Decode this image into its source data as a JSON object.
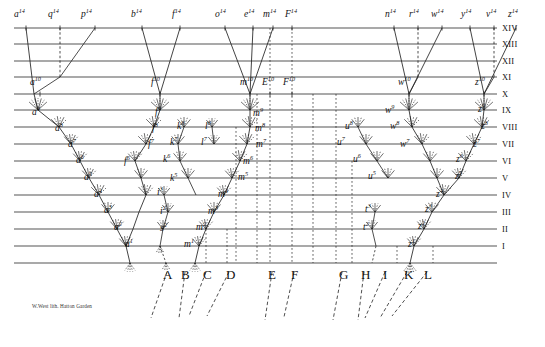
{
  "figure": {
    "credit": "W.West lith.  Hatton Garden",
    "colors": {
      "line": "#555555",
      "thin_line": "#222222",
      "text": "#111111",
      "background": "#ffffff"
    }
  },
  "levels": {
    "labels": [
      "I",
      "II",
      "III",
      "IV",
      "V",
      "VI",
      "VII",
      "VIII",
      "IX",
      "X",
      "XI",
      "XII",
      "XIII",
      "XIV"
    ],
    "y": [
      246,
      229,
      212,
      195,
      178,
      161,
      144,
      127,
      110,
      94,
      77,
      61,
      44,
      28
    ],
    "baseline_y": 263
  },
  "top_row_14": [
    {
      "name": "a",
      "sup": "14",
      "x": 14,
      "tick": 26
    },
    {
      "name": "q",
      "sup": "14",
      "x": 48,
      "tick": 60
    },
    {
      "name": "p",
      "sup": "14",
      "x": 81,
      "tick": 95
    },
    {
      "name": "b",
      "sup": "14",
      "x": 131,
      "tick": 142
    },
    {
      "name": "f",
      "sup": "14",
      "x": 172,
      "tick": 180
    },
    {
      "name": "o",
      "sup": "14",
      "x": 215,
      "tick": 225
    },
    {
      "name": "e",
      "sup": "14",
      "x": 244,
      "tick": 253
    },
    {
      "name": "m",
      "sup": "14",
      "x": 263,
      "tick": 273
    },
    {
      "name": "F",
      "sup": "14",
      "x": 285,
      "tick": 292
    },
    {
      "name": "n",
      "sup": "14",
      "x": 385,
      "tick": 394
    },
    {
      "name": "r",
      "sup": "14",
      "x": 409,
      "tick": 418
    },
    {
      "name": "w",
      "sup": "14",
      "x": 431,
      "tick": 442
    },
    {
      "name": "y",
      "sup": "14",
      "x": 461,
      "tick": 470
    },
    {
      "name": "v",
      "sup": "14",
      "x": 486,
      "tick": 494
    },
    {
      "name": "z",
      "sup": "14",
      "x": 508,
      "tick": 516
    }
  ],
  "row_10": [
    {
      "name": "a",
      "sup": "10",
      "x": 30,
      "tick": 40
    },
    {
      "name": "f",
      "sup": "10",
      "x": 151,
      "tick": 160
    },
    {
      "name": "m",
      "sup": "10",
      "x": 240,
      "tick": 250
    },
    {
      "name": "E",
      "sup": "10",
      "x": 262,
      "tick": 270
    },
    {
      "name": "F",
      "sup": "10",
      "x": 283,
      "tick": 292
    },
    {
      "name": "w",
      "sup": "10",
      "x": 398,
      "tick": 409
    },
    {
      "name": "z",
      "sup": "10",
      "x": 475,
      "tick": 484
    }
  ],
  "branch_labels": [
    {
      "name": "a",
      "sup": "9",
      "x": 32,
      "y": 106
    },
    {
      "name": "m",
      "sup": "9",
      "x": 253,
      "y": 107
    },
    {
      "name": "f",
      "sup": "9",
      "x": 155,
      "y": 106
    },
    {
      "name": "w",
      "sup": "9",
      "x": 385,
      "y": 104
    },
    {
      "name": "z",
      "sup": "9",
      "x": 478,
      "y": 103
    },
    {
      "name": "a",
      "sup": "8",
      "x": 55,
      "y": 122
    },
    {
      "name": "f",
      "sup": "8",
      "x": 152,
      "y": 122
    },
    {
      "name": "k",
      "sup": "8",
      "x": 177,
      "y": 120
    },
    {
      "name": "l",
      "sup": "8",
      "x": 205,
      "y": 120
    },
    {
      "name": "m",
      "sup": "8",
      "x": 255,
      "y": 122
    },
    {
      "name": "u",
      "sup": "8",
      "x": 345,
      "y": 120
    },
    {
      "name": "w",
      "sup": "8",
      "x": 390,
      "y": 120
    },
    {
      "name": "z",
      "sup": "8",
      "x": 481,
      "y": 120
    },
    {
      "name": "a",
      "sup": "7",
      "x": 68,
      "y": 138
    },
    {
      "name": "f",
      "sup": "7",
      "x": 148,
      "y": 138
    },
    {
      "name": "k",
      "sup": "7",
      "x": 170,
      "y": 136
    },
    {
      "name": "l",
      "sup": "7",
      "x": 201,
      "y": 136
    },
    {
      "name": "m",
      "sup": "7",
      "x": 256,
      "y": 138
    },
    {
      "name": "u",
      "sup": "7",
      "x": 337,
      "y": 136
    },
    {
      "name": "w",
      "sup": "7",
      "x": 400,
      "y": 138
    },
    {
      "name": "z",
      "sup": "7",
      "x": 473,
      "y": 138
    },
    {
      "name": "a",
      "sup": "6",
      "x": 76,
      "y": 154
    },
    {
      "name": "f",
      "sup": "6",
      "x": 124,
      "y": 155
    },
    {
      "name": "k",
      "sup": "6",
      "x": 163,
      "y": 153
    },
    {
      "name": "m",
      "sup": "6",
      "x": 243,
      "y": 155
    },
    {
      "name": "u",
      "sup": "6",
      "x": 353,
      "y": 153
    },
    {
      "name": "z",
      "sup": "6",
      "x": 456,
      "y": 153
    },
    {
      "name": "a",
      "sup": "5",
      "x": 84,
      "y": 171
    },
    {
      "name": "k",
      "sup": "5",
      "x": 170,
      "y": 172
    },
    {
      "name": "m",
      "sup": "5",
      "x": 238,
      "y": 171
    },
    {
      "name": "u",
      "sup": "5",
      "x": 368,
      "y": 170
    },
    {
      "name": "z",
      "sup": "5",
      "x": 455,
      "y": 170
    },
    {
      "name": "a",
      "sup": "4",
      "x": 94,
      "y": 188
    },
    {
      "name": "i",
      "sup": "3",
      "x": 157,
      "y": 186
    },
    {
      "name": "m",
      "sup": "4",
      "x": 218,
      "y": 188
    },
    {
      "name": "z",
      "sup": "4",
      "x": 436,
      "y": 188
    },
    {
      "name": "a",
      "sup": "3",
      "x": 104,
      "y": 204
    },
    {
      "name": "i",
      "sup": "2",
      "x": 160,
      "y": 205
    },
    {
      "name": "m",
      "sup": "3",
      "x": 208,
      "y": 205
    },
    {
      "name": "t",
      "sup": "3",
      "x": 365,
      "y": 203
    },
    {
      "name": "z",
      "sup": "3",
      "x": 425,
      "y": 203
    },
    {
      "name": "a",
      "sup": "2",
      "x": 114,
      "y": 221
    },
    {
      "name": "s",
      "sup": "2",
      "x": 160,
      "y": 222
    },
    {
      "name": "m",
      "sup": "2",
      "x": 196,
      "y": 221
    },
    {
      "name": "t",
      "sup": "2",
      "x": 363,
      "y": 221
    },
    {
      "name": "z",
      "sup": "2",
      "x": 418,
      "y": 220
    },
    {
      "name": "a",
      "sup": "1",
      "x": 125,
      "y": 238
    },
    {
      "name": "m",
      "sup": "1",
      "x": 184,
      "y": 238
    },
    {
      "name": "z",
      "sup": "1",
      "x": 408,
      "y": 238
    }
  ],
  "genera": [
    {
      "label": "A",
      "x": 163,
      "y": 267
    },
    {
      "label": "B",
      "x": 181,
      "y": 267
    },
    {
      "label": "C",
      "x": 203,
      "y": 267
    },
    {
      "label": "D",
      "x": 226,
      "y": 267
    },
    {
      "label": "E",
      "x": 268,
      "y": 267
    },
    {
      "label": "F",
      "x": 291,
      "y": 267
    },
    {
      "label": "G",
      "x": 339,
      "y": 267
    },
    {
      "label": "H",
      "x": 361,
      "y": 267
    },
    {
      "label": "I",
      "x": 383,
      "y": 267
    },
    {
      "label": "K",
      "x": 404,
      "y": 267
    },
    {
      "label": "L",
      "x": 424,
      "y": 267
    }
  ],
  "root_fan": {
    "description": "Dashed lines descending below baseline from genera A-L",
    "lines": [
      {
        "x1": 167,
        "y1": 272,
        "x2": 151,
        "y2": 318
      },
      {
        "x1": 185,
        "y1": 272,
        "x2": 179,
        "y2": 318
      },
      {
        "x1": 206,
        "y1": 272,
        "x2": 189,
        "y2": 316
      },
      {
        "x1": 229,
        "y1": 272,
        "x2": 207,
        "y2": 316
      },
      {
        "x1": 272,
        "y1": 272,
        "x2": 265,
        "y2": 320
      },
      {
        "x1": 294,
        "y1": 272,
        "x2": 284,
        "y2": 317
      },
      {
        "x1": 342,
        "y1": 272,
        "x2": 333,
        "y2": 320
      },
      {
        "x1": 364,
        "y1": 272,
        "x2": 358,
        "y2": 320
      },
      {
        "x1": 385,
        "y1": 272,
        "x2": 365,
        "y2": 318
      },
      {
        "x1": 407,
        "y1": 272,
        "x2": 380,
        "y2": 318
      },
      {
        "x1": 427,
        "y1": 272,
        "x2": 392,
        "y2": 316
      }
    ]
  },
  "long_verticals": [
    {
      "x_top": 60,
      "x_bottom": 60,
      "label": "q14 dashed vertical"
    },
    {
      "x_top": 292,
      "x_bottom": 292,
      "label": "F14 to F"
    },
    {
      "x_top": 270,
      "x_bottom": 270,
      "label": "E14 to E"
    },
    {
      "x_top": 418,
      "x_bottom": 418,
      "label": "r14 dashed"
    },
    {
      "x_top": 494,
      "x_bottom": 494,
      "label": "v14 dashed"
    }
  ]
}
